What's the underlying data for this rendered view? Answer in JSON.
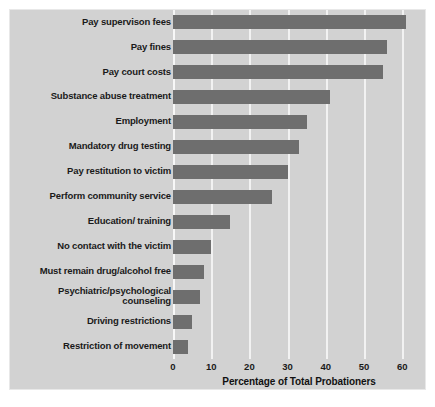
{
  "chart_data": {
    "type": "bar",
    "orientation": "horizontal",
    "title": "",
    "xlabel": "Percentage of Total Probationers",
    "ylabel": "",
    "xlim": [
      0,
      63
    ],
    "xticks": [
      0,
      10,
      20,
      30,
      40,
      50,
      60
    ],
    "xtick_labels": [
      "0",
      "10",
      "20",
      "30",
      "40",
      "50",
      "60"
    ],
    "grid": "vertical",
    "legend": "none",
    "categories": [
      "Pay supervison fees",
      "Pay fines",
      "Pay court costs",
      "Substance abuse treatment",
      "Employment",
      "Mandatory drug testing",
      "Pay restitution to victim",
      "Perform community service",
      "Education/ training",
      "No contact with the victim",
      "Must remain drug/alcohol free",
      "Psychiatric/psychological counseling",
      "Driving restrictions",
      "Restriction of movement"
    ],
    "values": [
      61,
      56,
      55,
      41,
      35,
      33,
      30,
      26,
      15,
      10,
      8,
      7,
      5,
      4
    ],
    "colors": {
      "bar": "#6e6e6e",
      "panel_background": "#d2d2d2",
      "gridline": "#f2f2f2",
      "text": "#1a1a1a",
      "figure_background": "#ffffff"
    }
  }
}
